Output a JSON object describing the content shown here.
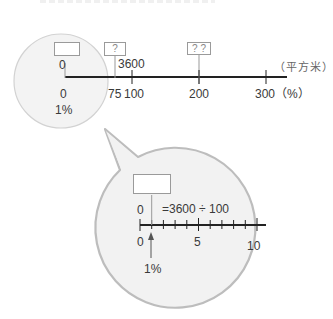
{
  "main_line": {
    "unit_label": "（平方米）",
    "top_values": [
      "0",
      "3600"
    ],
    "boxes": [
      "",
      "?",
      "? ?"
    ],
    "bottom_ticks": [
      "0",
      "75",
      "100",
      "200",
      "300（%）"
    ],
    "percent_label": "1%"
  },
  "zoom_bubble": {
    "box_value": "",
    "top_zero": "0",
    "equation": "=3600 ÷ 100",
    "bottom_ticks": [
      "0",
      "5",
      "10"
    ],
    "percent_label": "1%"
  },
  "colors": {
    "line": "#222222",
    "circle_fill": "#f2f2f2",
    "circle_stroke": "#c8c8c8",
    "bubble_stroke": "#bdbdbd",
    "box_stroke": "#9a9a9a"
  }
}
